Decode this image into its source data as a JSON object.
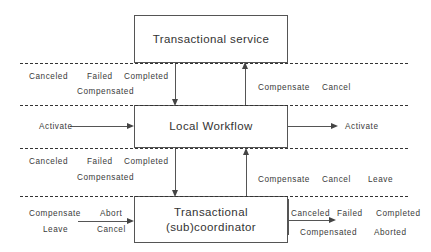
{
  "diagram": {
    "boxes": {
      "service": {
        "label": "Transactional service"
      },
      "workflow": {
        "label": "Local Workflow"
      },
      "coordinator_line1": "Transactional",
      "coordinator_line2": "(sub)coordinator"
    },
    "band_upper_left": {
      "canceled": "Canceled",
      "failed": "Failed",
      "completed": "Completed",
      "compensated": "Compensated"
    },
    "band_upper_right": {
      "compensate": "Compensate",
      "cancel": "Cancel"
    },
    "band_middle_left": {
      "activate": "Activate"
    },
    "band_middle_right": {
      "activate": "Activate"
    },
    "band_lower_left": {
      "canceled": "Canceled",
      "failed": "Failed",
      "completed": "Completed",
      "compensated": "Compensated"
    },
    "band_lower_right": {
      "compensate": "Compensate",
      "cancel": "Cancel",
      "leave": "Leave"
    },
    "band_bottom_left": {
      "compensate": "Compensate",
      "abort": "Abort",
      "leave": "Leave",
      "cancel": "Cancel"
    },
    "band_bottom_right": {
      "canceled": "Canceled",
      "failed": "Failed",
      "completed": "Completed",
      "compensated": "Compensated",
      "aborted": "Aborted"
    },
    "colors": {
      "line": "#555555",
      "text": "#3a3a3a",
      "dashed": "#333333",
      "background": "#ffffff"
    }
  }
}
